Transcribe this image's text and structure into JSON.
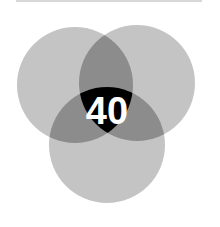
{
  "diagram": {
    "type": "venn",
    "sets": [
      {
        "name": "left-circle",
        "cx": 75,
        "cy": 85,
        "r": 58
      },
      {
        "name": "right-circle",
        "cx": 137,
        "cy": 83,
        "r": 58
      },
      {
        "name": "bottom-circle",
        "cx": 107,
        "cy": 145,
        "r": 58
      }
    ],
    "center_label": "40",
    "colors": {
      "single": "#c4c4c4",
      "pair": "#8c8c8c",
      "triple": "#000000",
      "text": "#ffffff"
    }
  }
}
